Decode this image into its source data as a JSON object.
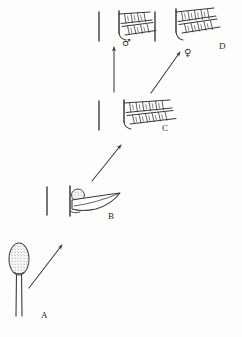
{
  "figure": {
    "background_color": "#fdfdfc",
    "ink_color": "#3a3a3a",
    "panel_labels": [
      {
        "id": "A",
        "text": "A",
        "x": 41,
        "y": 311
      },
      {
        "id": "B",
        "text": "B",
        "x": 108,
        "y": 212
      },
      {
        "id": "C",
        "text": "C",
        "x": 162,
        "y": 124
      },
      {
        "id": "D",
        "text": "D",
        "x": 219,
        "y": 42
      }
    ],
    "sex_symbols": [
      {
        "id": "male",
        "text": "♂",
        "name": "male-symbol",
        "x": 122,
        "y": 38
      },
      {
        "id": "female",
        "text": "♀",
        "name": "female-symbol",
        "x": 184,
        "y": 48
      }
    ],
    "stages": [
      {
        "id": "A",
        "label": "A",
        "description": "stippled ovoid spore body on a slender two-line stalk"
      },
      {
        "id": "B",
        "label": "B",
        "description": "vertical axis bar with small stippled body and elongate leaf blade"
      },
      {
        "id": "C",
        "label": "C",
        "description": "vertical axis bar with two rows of rectangular segments forming a frond"
      },
      {
        "id": "D",
        "label": "D",
        "description": "mature frond with two rows of rectangular segments, male and female branches"
      }
    ],
    "arrows": [
      {
        "id": "a-to-b",
        "from": "A",
        "to": "B",
        "direction": "up-right"
      },
      {
        "id": "b-to-c",
        "from": "B",
        "to": "C",
        "direction": "up-right"
      },
      {
        "id": "c-to-male",
        "from": "C",
        "to": "male",
        "direction": "up"
      },
      {
        "id": "c-to-female",
        "from": "C",
        "to": "female",
        "direction": "up-right"
      }
    ]
  }
}
